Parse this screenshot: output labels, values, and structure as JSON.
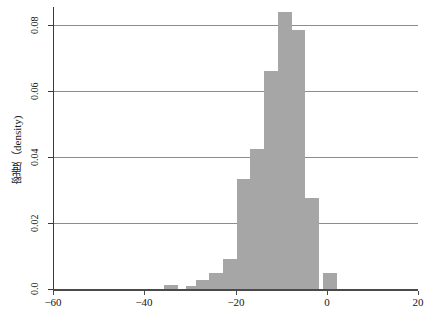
{
  "chart_data": {
    "type": "bar",
    "title": "",
    "subtitle": "",
    "xlabel": "",
    "ylabel": "密度（density)",
    "xlim": [
      -60,
      20
    ],
    "ylim": [
      0,
      0.0865
    ],
    "grid": "horizontal",
    "legend": "none",
    "bar_color": "#a6a6a6",
    "bin_width": 4,
    "x_ticks": [
      -60,
      -40,
      -20,
      0,
      20
    ],
    "x_tick_labels": [
      "−60",
      "−40",
      "−20",
      "0",
      "20"
    ],
    "y_ticks": [
      0,
      0.02,
      0.04,
      0.06,
      0.08
    ],
    "y_tick_labels": [
      "0.0",
      "0.02",
      "0.04",
      "0.06",
      "0.08"
    ],
    "bins": [
      {
        "x0": -36,
        "x1": -32,
        "value": 0.0013
      },
      {
        "x0": -32,
        "x1": -28,
        "value": 0.0
      },
      {
        "x0": -28,
        "x1": -24,
        "value": 0.001
      },
      {
        "x0": -24,
        "x1": -20,
        "value": 0.0026
      },
      {
        "x0": -20,
        "x1": -16,
        "value": 0.005
      },
      {
        "x0": -16,
        "x1": -12,
        "value": 0.009
      },
      {
        "x0": -12,
        "x1": -8,
        "value": 0.0333
      },
      {
        "x0": -8,
        "x1": -4,
        "value": 0.0424
      },
      {
        "x0": -4,
        "x1": 0,
        "value": 0.066
      },
      {
        "x0": 0,
        "x1": 4,
        "value": 0.084
      },
      {
        "x0": 4,
        "x1": 8,
        "value": 0.0785
      },
      {
        "x0": 8,
        "x1": 12,
        "value": 0.0277
      },
      {
        "x0": 12,
        "x1": 16,
        "value": 0.0048
      }
    ],
    "bars_plotted": [
      {
        "center": -34,
        "value": 0.0013
      },
      {
        "center": -29,
        "value": 0.001
      },
      {
        "center": -27,
        "value": 0.0026
      },
      {
        "center": -24,
        "value": 0.005
      },
      {
        "center": -21,
        "value": 0.009
      },
      {
        "center": -18,
        "value": 0.0333
      },
      {
        "center": -15,
        "value": 0.0424
      },
      {
        "center": -12,
        "value": 0.066
      },
      {
        "center": -9,
        "value": 0.084
      },
      {
        "center": -6,
        "value": 0.0785
      },
      {
        "center": -3,
        "value": 0.0277
      },
      {
        "center": 1,
        "value": 0.0048
      }
    ]
  }
}
